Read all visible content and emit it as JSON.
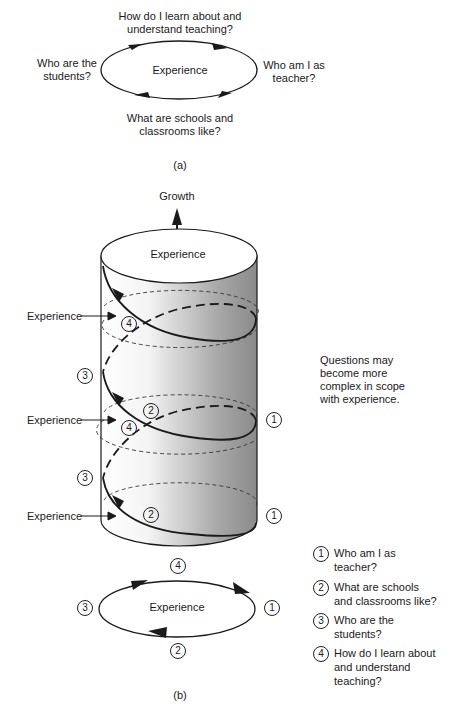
{
  "panel_a": {
    "center": "Experience",
    "top": "How do I learn about and understand teaching?",
    "top_line1": "How do I learn about and",
    "top_line2": "understand teaching?",
    "left_line1": "Who are the",
    "left_line2": "students?",
    "right_line1": "Who am I as",
    "right_line2": "teacher?",
    "bottom_line1": "What are schools and",
    "bottom_line2": "classrooms like?",
    "caption": "(a)"
  },
  "panel_b": {
    "growth": "Growth",
    "top_label": "Experience",
    "side_labels": [
      "Experience",
      "Experience",
      "Experience"
    ],
    "note_line1": "Questions may",
    "note_line2": "become more",
    "note_line3": "complex in scope",
    "note_line4": "with experience.",
    "markers": {
      "one": "1",
      "two": "2",
      "three": "3",
      "four": "4"
    },
    "cycle_center": "Experience",
    "caption": "(b)"
  },
  "legend": [
    {
      "num": "1",
      "line1": "Who am I as",
      "line2": "teacher?",
      "line3": ""
    },
    {
      "num": "2",
      "line1": "What are schools",
      "line2": "and classrooms like?",
      "line3": ""
    },
    {
      "num": "3",
      "line1": "Who are the",
      "line2": "students?",
      "line3": ""
    },
    {
      "num": "4",
      "line1": "How do I learn about",
      "line2": "and understand",
      "line3": "teaching?"
    }
  ],
  "colors": {
    "ink": "#1a1a1a",
    "shade_dark": "#8a8a8a",
    "shade_light": "#ffffff"
  }
}
